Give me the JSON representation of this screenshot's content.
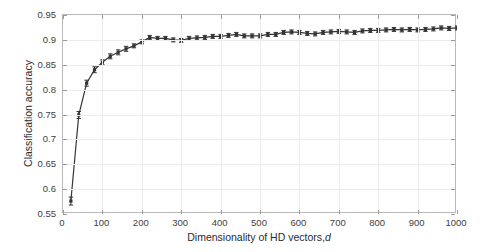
{
  "chart_data": {
    "type": "line",
    "title": "",
    "xlabel": "Dimensionality of HD vectors, d",
    "xlabel_plain": "Dimensionality of HD vectors,",
    "xlabel_italic": "d",
    "ylabel": "Classification accuracy",
    "xlim": [
      0,
      1000
    ],
    "ylim": [
      0.55,
      0.95
    ],
    "xticks": [
      0,
      100,
      200,
      300,
      400,
      500,
      600,
      700,
      800,
      900,
      1000
    ],
    "xticklabels": [
      "0",
      "100",
      "200",
      "300",
      "400",
      "500",
      "600",
      "700",
      "800",
      "900",
      "1000"
    ],
    "yticks": [
      0.55,
      0.6,
      0.65,
      0.7,
      0.75,
      0.8,
      0.85,
      0.9,
      0.95
    ],
    "yticklabels": [
      "0.55",
      "0.6",
      "0.65",
      "0.7",
      "0.75",
      "0.8",
      "0.85",
      "0.9",
      "0.95"
    ],
    "grid": true,
    "legend": "none",
    "marker": "square",
    "error_bars": true,
    "line_color": "#333333",
    "grid_color": "#ececec",
    "axis_color": "#b9b9b9",
    "series": [
      {
        "name": "Classification accuracy vs dimensionality",
        "x": [
          20,
          40,
          60,
          80,
          100,
          120,
          140,
          160,
          180,
          200,
          220,
          240,
          260,
          280,
          300,
          320,
          340,
          360,
          380,
          400,
          420,
          440,
          460,
          480,
          500,
          520,
          540,
          560,
          580,
          600,
          620,
          640,
          660,
          680,
          700,
          720,
          740,
          760,
          780,
          800,
          820,
          840,
          860,
          880,
          900,
          920,
          940,
          960,
          980,
          1000
        ],
        "y": [
          0.576,
          0.749,
          0.813,
          0.84,
          0.855,
          0.867,
          0.875,
          0.882,
          0.888,
          0.896,
          0.905,
          0.903,
          0.903,
          0.9,
          0.899,
          0.903,
          0.904,
          0.905,
          0.907,
          0.907,
          0.909,
          0.911,
          0.908,
          0.908,
          0.908,
          0.911,
          0.911,
          0.915,
          0.916,
          0.915,
          0.913,
          0.912,
          0.915,
          0.916,
          0.917,
          0.916,
          0.915,
          0.918,
          0.919,
          0.919,
          0.92,
          0.921,
          0.92,
          0.921,
          0.92,
          0.921,
          0.922,
          0.924,
          0.923,
          0.924
        ],
        "yerr": [
          0.008,
          0.007,
          0.006,
          0.006,
          0.005,
          0.005,
          0.005,
          0.005,
          0.004,
          0.004,
          0.004,
          0.004,
          0.004,
          0.004,
          0.004,
          0.004,
          0.004,
          0.004,
          0.004,
          0.004,
          0.004,
          0.004,
          0.004,
          0.004,
          0.004,
          0.004,
          0.004,
          0.004,
          0.004,
          0.004,
          0.004,
          0.004,
          0.004,
          0.004,
          0.004,
          0.004,
          0.004,
          0.004,
          0.004,
          0.004,
          0.004,
          0.004,
          0.004,
          0.004,
          0.004,
          0.004,
          0.004,
          0.004,
          0.004,
          0.004
        ]
      }
    ]
  }
}
